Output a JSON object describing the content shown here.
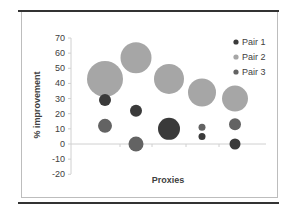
{
  "chart_data": {
    "type": "bubble",
    "title": "",
    "xlabel": "Proxies",
    "ylabel": "% improvement",
    "ylim": [
      -20,
      70
    ],
    "yticks": [
      70,
      60,
      50,
      40,
      30,
      20,
      10,
      0,
      -10,
      -20
    ],
    "x": [
      1,
      2,
      3,
      4,
      5
    ],
    "grid": false,
    "legend_position": "right-top",
    "series": [
      {
        "name": "Pair 1",
        "color": "#3a3a3a",
        "values": [
          29,
          22,
          10,
          5,
          0
        ],
        "sizes": [
          6,
          6,
          11,
          3.5,
          5.5
        ]
      },
      {
        "name": "Pair 2",
        "color": "#a6a6a6",
        "values": [
          43,
          57,
          43,
          34,
          30
        ],
        "sizes": [
          18,
          15.5,
          15,
          14,
          13
        ]
      },
      {
        "name": "Pair 3",
        "color": "#636363",
        "values": [
          12,
          0,
          8,
          11,
          13
        ],
        "sizes": [
          7,
          7.5,
          6,
          3.5,
          6
        ]
      }
    ]
  },
  "legend": {
    "items": [
      {
        "label": "Pair 1",
        "color": "#3a3a3a"
      },
      {
        "label": "Pair 2",
        "color": "#a6a6a6"
      },
      {
        "label": "Pair 3",
        "color": "#636363"
      }
    ]
  },
  "axes": {
    "y_title": "% improvement",
    "x_title": "Proxies",
    "y_tick_labels": [
      "70",
      "60",
      "50",
      "40",
      "30",
      "20",
      "10",
      "0",
      "-10",
      "-20"
    ]
  }
}
